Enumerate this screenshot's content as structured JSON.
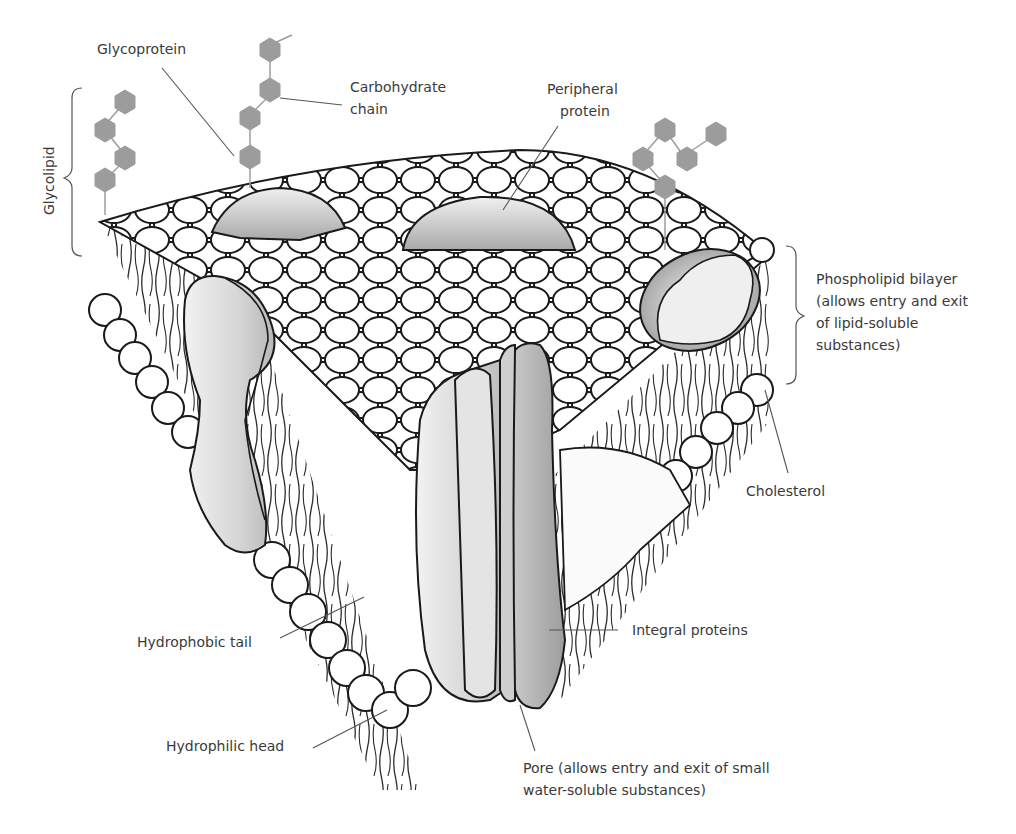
{
  "labels": {
    "glycoprotein": "Glycoprotein",
    "carbohydrate_chain_1": "Carbohydrate",
    "carbohydrate_chain_2": "chain",
    "peripheral_protein_1": "Peripheral",
    "peripheral_protein_2": "protein",
    "glycolipid": "Glycolipid",
    "phospholipid_bilayer_1": "Phospholipid bilayer",
    "phospholipid_bilayer_2": "(allows entry and exit",
    "phospholipid_bilayer_3": "of lipid-soluble",
    "phospholipid_bilayer_4": "substances)",
    "cholesterol": "Cholesterol",
    "integral_proteins": "Integral proteins",
    "hydrophobic_tail": "Hydrophobic tail",
    "hydrophilic_head": "Hydrophilic head",
    "pore_1": "Pore (allows entry and exit of small",
    "pore_2": "water-soluble substances)"
  },
  "colors": {
    "outline": "#1a1a1a",
    "head_fill": "#ffffff",
    "protein_light": "#e6e6e6",
    "protein_dark": "#a8a8a8",
    "sugar": "#9c9c9c",
    "leader": "#555555",
    "text": "#3a3a3a"
  }
}
